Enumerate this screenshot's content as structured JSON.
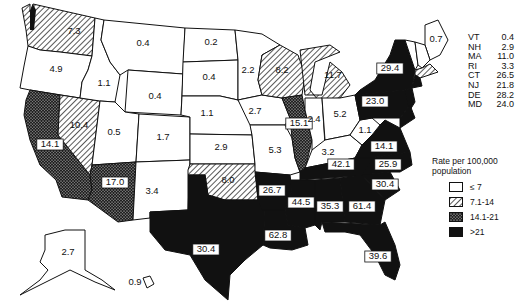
{
  "map": {
    "subject": "United States rate per 100,000 population by state",
    "categories": [
      {
        "key": "low",
        "label": "≤ 7",
        "pattern": "white"
      },
      {
        "key": "mid",
        "label": "7.1-14",
        "pattern": "hatched"
      },
      {
        "key": "high",
        "label": "14.1-21",
        "pattern": "stippled"
      },
      {
        "key": "top",
        "label": ">21",
        "pattern": "black"
      }
    ],
    "colors": {
      "fill_white": "#ffffff",
      "fill_black": "#111111",
      "stroke": "#111111"
    },
    "states": [
      {
        "code": "WA",
        "value": "7.3",
        "category": "mid"
      },
      {
        "code": "OR",
        "value": "4.9",
        "category": "low"
      },
      {
        "code": "CA",
        "value": "14.1",
        "category": "high"
      },
      {
        "code": "NV",
        "value": "10.4",
        "category": "mid"
      },
      {
        "code": "ID",
        "value": "1.1",
        "category": "low"
      },
      {
        "code": "MT",
        "value": "0.4",
        "category": "low"
      },
      {
        "code": "WY",
        "value": "0.4",
        "category": "low"
      },
      {
        "code": "UT",
        "value": "0.5",
        "category": "low"
      },
      {
        "code": "AZ",
        "value": "17.0",
        "category": "high"
      },
      {
        "code": "CO",
        "value": "1.7",
        "category": "low"
      },
      {
        "code": "NM",
        "value": "3.4",
        "category": "low"
      },
      {
        "code": "ND",
        "value": "0.2",
        "category": "low"
      },
      {
        "code": "SD",
        "value": "0.4",
        "category": "low"
      },
      {
        "code": "NE",
        "value": "1.1",
        "category": "low"
      },
      {
        "code": "KS",
        "value": "2.9",
        "category": "low"
      },
      {
        "code": "OK",
        "value": "8.0",
        "category": "mid"
      },
      {
        "code": "TX",
        "value": "30.4",
        "category": "top"
      },
      {
        "code": "MN",
        "value": "2.2",
        "category": "low"
      },
      {
        "code": "IA",
        "value": "2.7",
        "category": "low"
      },
      {
        "code": "MO",
        "value": "5.3",
        "category": "low"
      },
      {
        "code": "AR",
        "value": "26.7",
        "category": "top"
      },
      {
        "code": "LA",
        "value": "62.8",
        "category": "top"
      },
      {
        "code": "WI",
        "value": "8.2",
        "category": "mid"
      },
      {
        "code": "IL",
        "value": "15.1",
        "category": "high"
      },
      {
        "code": "MI",
        "value": "11.7",
        "category": "mid"
      },
      {
        "code": "IN",
        "value": "2.4",
        "category": "low"
      },
      {
        "code": "OH",
        "value": "5.2",
        "category": "low"
      },
      {
        "code": "KY",
        "value": "3.2",
        "category": "low"
      },
      {
        "code": "TN",
        "value": "42.1",
        "category": "top"
      },
      {
        "code": "MS",
        "value": "44.5",
        "category": "top"
      },
      {
        "code": "AL",
        "value": "35.3",
        "category": "top"
      },
      {
        "code": "GA",
        "value": "61.4",
        "category": "top"
      },
      {
        "code": "FL",
        "value": "39.6",
        "category": "top"
      },
      {
        "code": "SC",
        "value": "30.4",
        "category": "top"
      },
      {
        "code": "NC",
        "value": "25.9",
        "category": "top"
      },
      {
        "code": "VA",
        "value": "14.1",
        "category": "top"
      },
      {
        "code": "WV",
        "value": "1.1",
        "category": "low"
      },
      {
        "code": "PA",
        "value": "23.0",
        "category": "top"
      },
      {
        "code": "NY",
        "value": "29.4",
        "category": "top"
      },
      {
        "code": "ME",
        "value": "0.7",
        "category": "low"
      },
      {
        "code": "AK",
        "value": "2.7",
        "category": "low"
      },
      {
        "code": "HI",
        "value": "0.9",
        "category": "low"
      }
    ],
    "small_states": [
      {
        "code": "VT",
        "value": "0.4"
      },
      {
        "code": "NH",
        "value": "2.9"
      },
      {
        "code": "MA",
        "value": "11.0"
      },
      {
        "code": "RI",
        "value": "3.3"
      },
      {
        "code": "CT",
        "value": "26.5"
      },
      {
        "code": "NJ",
        "value": "21.8"
      },
      {
        "code": "DE",
        "value": "28.2"
      },
      {
        "code": "MD",
        "value": "24.0"
      }
    ],
    "legend": {
      "title_line1": "Rate per 100,000",
      "title_line2": "population"
    }
  }
}
